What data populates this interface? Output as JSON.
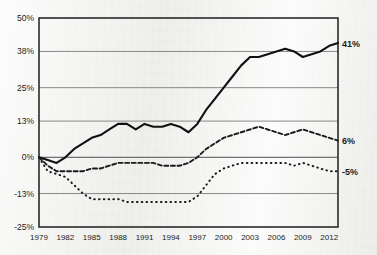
{
  "chart_data": {
    "type": "line",
    "title": "",
    "xlabel": "",
    "ylabel": "",
    "xlim": [
      1979,
      2013
    ],
    "ylim": [
      -25,
      50
    ],
    "grid": true,
    "legend": "none",
    "ytick_labels": [
      "50%",
      "38%",
      "25%",
      "13%",
      "0%",
      "-13%",
      "-25%"
    ],
    "ytick_values": [
      50,
      38,
      25,
      13,
      0,
      -13,
      -25
    ],
    "xtick_labels": [
      "1979",
      "1982",
      "1985",
      "1988",
      "1991",
      "1994",
      "1997",
      "2000",
      "2003",
      "2006",
      "2009",
      "2012"
    ],
    "xtick_values": [
      1979,
      1982,
      1985,
      1988,
      1991,
      1994,
      1997,
      2000,
      2003,
      2006,
      2009,
      2012
    ],
    "x": [
      1979,
      1980,
      1981,
      1982,
      1983,
      1984,
      1985,
      1986,
      1987,
      1988,
      1989,
      1990,
      1991,
      1992,
      1993,
      1994,
      1995,
      1996,
      1997,
      1998,
      1999,
      2000,
      2001,
      2002,
      2003,
      2004,
      2005,
      2006,
      2007,
      2008,
      2009,
      2010,
      2011,
      2012,
      2013
    ],
    "end_labels": [
      {
        "series": "top",
        "text": "41%",
        "value": 41
      },
      {
        "series": "middle",
        "text": "6%",
        "value": 6
      },
      {
        "series": "bottom",
        "text": "-5%",
        "value": -5
      }
    ],
    "series": [
      {
        "name": "top",
        "style": "solid",
        "values": [
          0,
          -1,
          -2,
          0,
          3,
          5,
          7,
          8,
          10,
          12,
          12,
          10,
          12,
          11,
          11,
          12,
          11,
          9,
          12,
          17,
          21,
          25,
          29,
          33,
          36,
          36,
          37,
          38,
          39,
          38,
          36,
          37,
          38,
          40,
          41
        ]
      },
      {
        "name": "middle",
        "style": "dashed",
        "values": [
          0,
          -3,
          -5,
          -5,
          -5,
          -5,
          -4,
          -4,
          -3,
          -2,
          -2,
          -2,
          -2,
          -2,
          -3,
          -3,
          -3,
          -2,
          0,
          3,
          5,
          7,
          8,
          9,
          10,
          11,
          10,
          9,
          8,
          9,
          10,
          9,
          8,
          7,
          6
        ]
      },
      {
        "name": "bottom",
        "style": "dotted",
        "values": [
          0,
          -5,
          -6,
          -7,
          -10,
          -13,
          -15,
          -15,
          -15,
          -15,
          -16,
          -16,
          -16,
          -16,
          -16,
          -16,
          -16,
          -16,
          -14,
          -10,
          -6,
          -4,
          -3,
          -2,
          -2,
          -2,
          -2,
          -2,
          -2,
          -3,
          -2,
          -3,
          -4,
          -5,
          -5
        ]
      }
    ]
  },
  "figure": {
    "caption": ""
  }
}
